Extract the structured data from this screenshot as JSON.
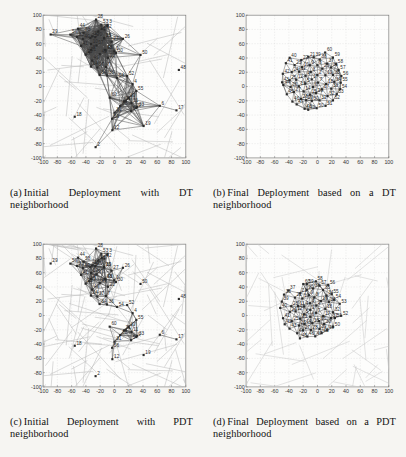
{
  "figure": {
    "background": "#f6f5f2",
    "panels": [
      {
        "id": "a",
        "caption_label": "(a)",
        "caption_text": "Initial Deployment with DT neighborhood",
        "caption_line1": "Initial Deployment with DT",
        "caption_line2": "neighborhood"
      },
      {
        "id": "b",
        "caption_label": "(b)",
        "caption_text": "Final Deployment based on a DT neighborhood",
        "caption_line1": "Final Deployment based on a",
        "caption_line2": "DT neighborhood"
      },
      {
        "id": "c",
        "caption_label": "(c)",
        "caption_text": "Initial Deployment with PDT neighborhood",
        "caption_line1": "Initial Deployment with PDT",
        "caption_line2": "neighborhood"
      },
      {
        "id": "d",
        "caption_label": "(d)",
        "caption_text": "Final Deployment based on a PDT neighborhood",
        "caption_line1": "Final Deployment based on a",
        "caption_line2": "PDT neighborhood"
      }
    ]
  },
  "chart_data": [
    {
      "type": "scatter",
      "panel": "a",
      "title": "Initial Deployment with DT neighborhood",
      "xlabel": "",
      "ylabel": "",
      "xlim": [
        -100,
        100
      ],
      "ylim": [
        -100,
        100
      ],
      "xticks": [
        -100,
        -80,
        -60,
        -40,
        -20,
        0,
        20,
        40,
        60,
        80,
        100
      ],
      "yticks": [
        -100,
        -80,
        -60,
        -40,
        -20,
        0,
        20,
        40,
        60,
        80,
        100
      ],
      "xticklabels": [
        "-100",
        "-80",
        "-60",
        "-40",
        "-20",
        "0",
        "20",
        "40",
        "60",
        "80",
        "100"
      ],
      "yticklabels": [
        "-100",
        "-80",
        "-60",
        "-40",
        "-20",
        "0",
        "20",
        "40",
        "60",
        "80",
        "100"
      ],
      "grid": true,
      "marker": "square",
      "marker_color": "#2b2b2b",
      "edge_color": "#4a4a4a",
      "voronoi_color": "#b9b9b9",
      "node_count": 60,
      "x": [
        -62,
        -60,
        -36,
        -24,
        -5,
        10,
        22,
        30,
        36,
        -46,
        -40,
        -44,
        -52,
        -54,
        -50,
        -44,
        -36,
        -20,
        -2,
        4,
        8,
        16,
        28,
        60,
        88,
        -58,
        -50,
        -38,
        -28,
        -18,
        -6,
        6,
        20,
        34,
        48,
        62,
        78,
        -66,
        -56,
        -44,
        -30,
        -14,
        0,
        14,
        26,
        44,
        66,
        82,
        -84,
        -72,
        -58,
        -42,
        -26,
        -10,
        8,
        24,
        40,
        58,
        74,
        86
      ],
      "y": [
        98,
        84,
        82,
        80,
        88,
        90,
        86,
        92,
        78,
        66,
        70,
        62,
        58,
        48,
        40,
        36,
        44,
        50,
        56,
        54,
        62,
        58,
        66,
        52,
        22,
        24,
        30,
        26,
        20,
        34,
        28,
        22,
        30,
        26,
        24,
        18,
        -8,
        -38,
        -22,
        -18,
        -12,
        -16,
        -20,
        -14,
        -10,
        -24,
        -34,
        -54,
        -38,
        -46,
        -50,
        -56,
        -62,
        -70,
        -78,
        -76,
        -68,
        -72,
        -80,
        -74
      ],
      "note": "Nodes are randomly/irregularly scattered with long Delaunay edges and light gray Voronoi cell boundaries."
    },
    {
      "type": "scatter",
      "panel": "b",
      "title": "Final Deployment based on a DT neighborhood",
      "xlabel": "",
      "ylabel": "",
      "xlim": [
        -100,
        100
      ],
      "ylim": [
        -100,
        100
      ],
      "xticks": [
        -100,
        -80,
        -60,
        -40,
        -20,
        0,
        20,
        40,
        60,
        80,
        100
      ],
      "yticks": [
        -100,
        -80,
        -60,
        -40,
        -20,
        0,
        20,
        40,
        60,
        80,
        100
      ],
      "xticklabels": [
        "-100",
        "-80",
        "-60",
        "-40",
        "-20",
        "0",
        "20",
        "40",
        "60",
        "80",
        "100"
      ],
      "yticklabels": [
        "-100",
        "-80",
        "-60",
        "-40",
        "-20",
        "0",
        "20",
        "40",
        "60",
        "80",
        "100"
      ],
      "grid": true,
      "marker": "square",
      "marker_color": "#2b2b2b",
      "edge_color": "#4a4a4a",
      "node_count": 60,
      "shape": "circular blob",
      "center": [
        -8,
        10
      ],
      "radius": 52,
      "note": "Nodes converge to an evenly spaced near-circular triangulated mesh centered slightly left of origin."
    },
    {
      "type": "scatter",
      "panel": "c",
      "title": "Initial Deployment with PDT neighborhood",
      "xlabel": "",
      "ylabel": "",
      "xlim": [
        -100,
        100
      ],
      "ylim": [
        -100,
        100
      ],
      "xticks": [
        -100,
        -80,
        -60,
        -40,
        -20,
        0,
        20,
        40,
        60,
        80,
        100
      ],
      "yticks": [
        -100,
        -80,
        -60,
        -40,
        -20,
        0,
        20,
        40,
        60,
        80,
        100
      ],
      "xticklabels": [
        "-100",
        "-80",
        "-60",
        "-40",
        "-20",
        "0",
        "20",
        "40",
        "60",
        "80",
        "100"
      ],
      "yticklabels": [
        "-100",
        "-80",
        "-60",
        "-40",
        "-20",
        "0",
        "20",
        "40",
        "60",
        "80",
        "100"
      ],
      "grid": true,
      "marker": "square",
      "marker_color": "#2b2b2b",
      "edge_color": "#4a4a4a",
      "voronoi_color": "#b9b9b9",
      "node_count": 60,
      "note": "Same initial random node positions as panel (a) but with sparser PDT edges over prominent light gray Voronoi diagram."
    },
    {
      "type": "scatter",
      "panel": "d",
      "title": "Final Deployment based on a PDT neighborhood",
      "xlabel": "",
      "ylabel": "",
      "xlim": [
        -100,
        100
      ],
      "ylim": [
        -100,
        100
      ],
      "xticks": [
        -100,
        -80,
        -60,
        -40,
        -20,
        0,
        20,
        40,
        60,
        80,
        100
      ],
      "yticks": [
        -100,
        -80,
        -60,
        -40,
        -20,
        0,
        20,
        40,
        60,
        80,
        100
      ],
      "xticklabels": [
        "-100",
        "-80",
        "-60",
        "-40",
        "-20",
        "0",
        "20",
        "40",
        "60",
        "80",
        "100"
      ],
      "yticklabels": [
        "-100",
        "-80",
        "-60",
        "-40",
        "-20",
        "0",
        "20",
        "40",
        "60",
        "80",
        "100"
      ],
      "grid": true,
      "marker": "square",
      "marker_color": "#2b2b2b",
      "edge_color": "#4a4a4a",
      "node_count": 60,
      "shape": "irregular rounded blob",
      "center": [
        -10,
        8
      ],
      "radius": 50,
      "note": "Nodes converge to a dense evenly spaced mesh with a more angular/irregular outline than panel (b)."
    }
  ]
}
